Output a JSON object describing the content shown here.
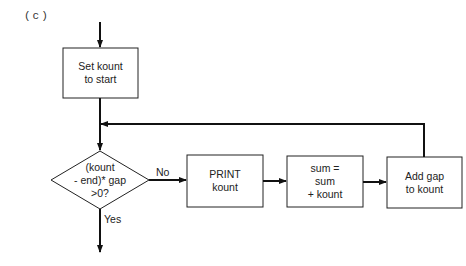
{
  "figure_label": "(c)",
  "nodes": {
    "set_kount": {
      "lines": [
        "Set kount",
        "to start"
      ]
    },
    "decision": {
      "lines": [
        "(kount",
        "- end)* gap",
        ">0?"
      ]
    },
    "print_kount": {
      "lines": [
        "PRINT",
        "kount"
      ]
    },
    "sum_update": {
      "lines": [
        "sum =",
        "sum",
        "+ kount"
      ]
    },
    "add_gap": {
      "lines": [
        "Add gap",
        "to kount"
      ]
    }
  },
  "edges": {
    "no_label": "No",
    "yes_label": "Yes"
  }
}
